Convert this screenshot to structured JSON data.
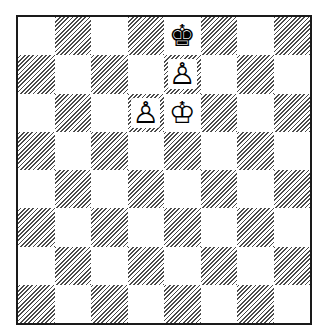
{
  "diagram": {
    "type": "chess-position",
    "orientation": "white-at-bottom",
    "colors": {
      "border": "#1a1a1a",
      "light_square": "#ffffff",
      "dark_square_hatch": "#4a4a4a"
    },
    "ranks": [
      "8",
      "7",
      "6",
      "5",
      "4",
      "3",
      "2",
      "1"
    ],
    "files": [
      "a",
      "b",
      "c",
      "d",
      "e",
      "f",
      "g",
      "h"
    ],
    "pieces": {
      "e8": {
        "color": "black",
        "type": "king",
        "glyph": "♚",
        "icon": "black-king-icon"
      },
      "e7": {
        "color": "white",
        "type": "pawn",
        "glyph": "♙",
        "icon": "white-pawn-icon"
      },
      "d6": {
        "color": "white",
        "type": "pawn",
        "glyph": "♙",
        "icon": "white-pawn-icon"
      },
      "e6": {
        "color": "white",
        "type": "king",
        "glyph": "♔",
        "icon": "white-king-icon"
      }
    }
  }
}
